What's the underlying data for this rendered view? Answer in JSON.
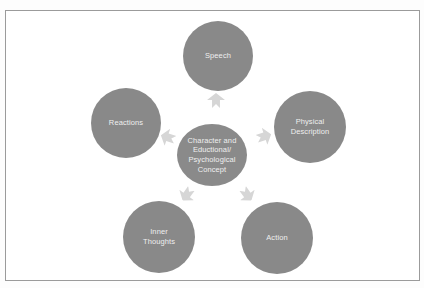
{
  "diagram": {
    "type": "radial-cycle",
    "center": {
      "label": "Character and\nEductional/\nPsychological\nConcept"
    },
    "nodes": [
      {
        "id": "speech",
        "label": "Speech"
      },
      {
        "id": "physical-description",
        "label": "Physical\nDescription"
      },
      {
        "id": "action",
        "label": "Action"
      },
      {
        "id": "inner-thoughts",
        "label": "Inner\nThoughts"
      },
      {
        "id": "reactions",
        "label": "Reactions"
      }
    ],
    "colors": {
      "circle_fill": "#898989",
      "arrow_fill": "#d6d6d6",
      "label_text": "#efefef",
      "frame_border": "#9b9b9b",
      "background": "#ffffff"
    }
  }
}
